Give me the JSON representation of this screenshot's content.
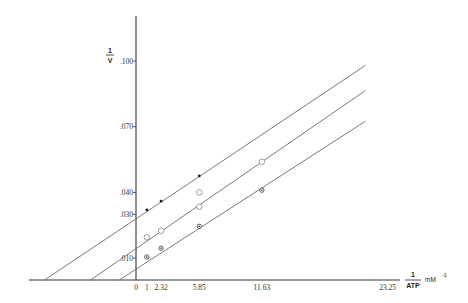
{
  "chart_data": {
    "type": "line",
    "title": "",
    "xlabel": "1/ATP",
    "xlabel_numerator": "1",
    "xlabel_denominator": "ATP",
    "xunit": "mM",
    "xunit_exp": "-1",
    "ylabel": "1/V",
    "ylabel_numerator": "1",
    "ylabel_denominator": "V",
    "xlim": [
      -9.8,
      25.2
    ],
    "ylim": [
      0,
      0.11
    ],
    "grid": false,
    "legend": "none",
    "x_ticks": [
      {
        "value": 0,
        "label": "0"
      },
      {
        "value": 1,
        "label": "1"
      },
      {
        "value": 2.32,
        "label": "2.32"
      },
      {
        "value": 5.85,
        "label": "5.85"
      },
      {
        "value": 11.63,
        "label": "11.63"
      },
      {
        "value": 23.25,
        "label": "23.25"
      }
    ],
    "y_ticks": [
      {
        "value": 0.01,
        "label": ".010"
      },
      {
        "value": 0.03,
        "label": ".030"
      },
      {
        "value": 0.04,
        "label": ".040"
      },
      {
        "value": 0.07,
        "label": ".070"
      },
      {
        "value": 0.1,
        "label": ".100"
      }
    ],
    "series": [
      {
        "name": "upper (filled dots)",
        "marker": "filled-dot",
        "line": {
          "x": [
            -8.45,
            21.2
          ],
          "y": [
            0,
            0.098
          ]
        },
        "y_intercept": 0.0295,
        "x_intercept": -8.45,
        "points": [
          {
            "x": 1,
            "y": 0.032
          },
          {
            "x": 2.32,
            "y": 0.036
          },
          {
            "x": 5.85,
            "y": 0.0475
          }
        ]
      },
      {
        "name": "middle (open circles)",
        "marker": "open-circle",
        "line": {
          "x": [
            -4.2,
            21.2
          ],
          "y": [
            0,
            0.0865
          ]
        },
        "y_intercept": 0.0143,
        "x_intercept": -4.2,
        "points": [
          {
            "x": 1,
            "y": 0.0195
          },
          {
            "x": 2.32,
            "y": 0.0225
          },
          {
            "x": 5.85,
            "y": 0.04
          },
          {
            "x": 5.85,
            "y": 0.0335
          },
          {
            "x": 11.63,
            "y": 0.054
          }
        ]
      },
      {
        "name": "lower (dotted circles)",
        "marker": "dotted-circle",
        "line": {
          "x": [
            -1.55,
            21.2
          ],
          "y": [
            0,
            0.0725
          ]
        },
        "y_intercept": 0.0048,
        "x_intercept": -1.55,
        "points": [
          {
            "x": 1,
            "y": 0.0105
          },
          {
            "x": 2.32,
            "y": 0.0145
          },
          {
            "x": 5.85,
            "y": 0.0245
          },
          {
            "x": 11.63,
            "y": 0.041
          }
        ]
      }
    ]
  },
  "layout": {
    "origin_px": [
      136,
      280
    ],
    "x_px_per_unit": 10.82,
    "y_px_per_unit": 2190,
    "x_axis_start_px": 29,
    "x_axis_end_px": 400,
    "y_axis_top_px": 16,
    "line_color": "#6a6a6a",
    "axis_color": "#333333"
  }
}
